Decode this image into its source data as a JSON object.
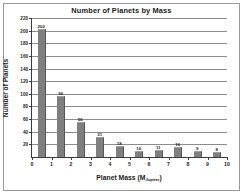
{
  "chart_data": {
    "type": "bar",
    "title": "Number of Planets by Mass",
    "xlabel": "Planet Mass (M",
    "xlabel_sub": "Jupiter",
    "xlabel_end": ")",
    "ylabel": "Number of Planets",
    "categories": [
      "0-1",
      "1-2",
      "2-3",
      "3-4",
      "4-5",
      "5-6",
      "6-7",
      "7-8",
      "8-9",
      "9-10"
    ],
    "bin_centers": [
      0.5,
      1.5,
      2.5,
      3.5,
      4.5,
      5.5,
      6.5,
      7.5,
      8.5,
      9.5
    ],
    "values": [
      202,
      96,
      56,
      31,
      18,
      10,
      11,
      16,
      9,
      8
    ],
    "value_labels": [
      "202",
      "96",
      "56",
      "31",
      "18",
      "10",
      "11",
      "16",
      "9",
      "8"
    ],
    "xlim": [
      0,
      10
    ],
    "ylim": [
      0,
      220
    ],
    "xticks": [
      0,
      1,
      2,
      3,
      4,
      5,
      6,
      7,
      8,
      9,
      10
    ],
    "xtick_labels": [
      "0",
      "1",
      "2",
      "3",
      "4",
      "5",
      "6",
      "7",
      "8",
      "9",
      "10"
    ],
    "yticks": [
      20,
      40,
      60,
      80,
      100,
      120,
      140,
      160,
      180,
      200,
      220
    ],
    "ytick_labels": [
      "20",
      "40",
      "60",
      "80",
      "100",
      "120",
      "140",
      "160",
      "180",
      "200",
      "220"
    ],
    "grid": true,
    "grid_axis": "y",
    "legend": false,
    "bar_color": "#7f7f7f",
    "bar_edge_color": "#555555",
    "grid_color": "#8c8c8c",
    "axis_color": "#3b3b3b",
    "text_color": "#1a1a1a",
    "background": "#ffffff",
    "frame_color": "#9a9a9a"
  }
}
